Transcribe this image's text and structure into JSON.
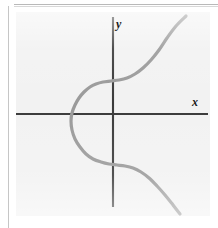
{
  "figure": {
    "kind": "coordinate-graph",
    "axis_labels": {
      "x": "x",
      "y": "y"
    },
    "colors": {
      "panel_background": "#f2f2f2",
      "page_background": "#ffffff",
      "axis": "#3a3a3a",
      "curve": "#9a9a9a",
      "rule": "#b9b9b9"
    }
  },
  "chart_data": {
    "type": "line",
    "title": "",
    "xlabel": "x",
    "ylabel": "y",
    "grid": false,
    "legend": null,
    "axes": {
      "x_axis_y_pixel": 114,
      "y_axis_x_pixel": 113,
      "x_axis_extent_px": [
        16,
        208
      ],
      "y_axis_extent_px": [
        17,
        207
      ],
      "x_ticks": [],
      "y_ticks": [],
      "xlim": [
        -3.2,
        3.2
      ],
      "ylim": [
        -3.4,
        3.4
      ]
    },
    "series": [
      {
        "name": "curve",
        "description": "monotone-increasing S shaped cubic-type curve with a long flat plateau just above the origin and a second plateau just below it; steep at both ends",
        "points_px": [
          [
            186,
            16
          ],
          [
            176,
            26
          ],
          [
            167,
            38
          ],
          [
            159,
            50
          ],
          [
            151,
            60
          ],
          [
            143,
            68
          ],
          [
            135,
            74
          ],
          [
            127,
            78
          ],
          [
            119,
            80
          ],
          [
            111,
            81
          ],
          [
            103,
            82
          ],
          [
            96,
            84
          ],
          [
            90,
            87
          ],
          [
            84,
            92
          ],
          [
            79,
            98
          ],
          [
            75,
            105
          ],
          [
            72,
            113
          ],
          [
            71,
            121
          ],
          [
            72,
            130
          ],
          [
            75,
            139
          ],
          [
            80,
            147
          ],
          [
            86,
            154
          ],
          [
            93,
            159
          ],
          [
            101,
            162
          ],
          [
            109,
            164
          ],
          [
            117,
            165
          ],
          [
            125,
            166
          ],
          [
            133,
            168
          ],
          [
            141,
            172
          ],
          [
            149,
            178
          ],
          [
            157,
            186
          ],
          [
            165,
            195
          ],
          [
            173,
            205
          ],
          [
            180,
            214
          ]
        ],
        "x": [
          2.3,
          1.86,
          1.45,
          1.1,
          0.81,
          0.55,
          0.33,
          0.16,
          0.04,
          -0.02,
          -0.1,
          -0.19,
          -0.3,
          -0.44,
          -0.6,
          -0.78,
          -0.95,
          -1.05,
          -0.95,
          -0.78,
          -0.58,
          -0.38,
          -0.2,
          -0.06,
          0.04,
          0.1,
          0.18,
          0.3,
          0.46,
          0.66,
          0.92,
          1.25,
          1.68,
          2.1
        ],
        "y": [
          3.05,
          2.8,
          2.48,
          2.16,
          1.9,
          1.68,
          1.52,
          1.42,
          1.36,
          1.33,
          1.3,
          1.25,
          1.17,
          1.05,
          0.88,
          0.68,
          0.42,
          0.12,
          -0.2,
          -0.48,
          -0.72,
          -0.92,
          -1.06,
          -1.14,
          -1.2,
          -1.23,
          -1.26,
          -1.32,
          -1.44,
          -1.62,
          -1.86,
          -2.16,
          -2.52,
          -2.88
        ]
      }
    ],
    "annotations": [
      {
        "text": "y",
        "role": "y-axis-label",
        "position_px": [
          116,
          18
        ],
        "style": "italic-serif-bold"
      },
      {
        "text": "x",
        "role": "x-axis-label",
        "position_px": [
          192,
          96
        ],
        "style": "italic-serif-bold"
      }
    ]
  }
}
